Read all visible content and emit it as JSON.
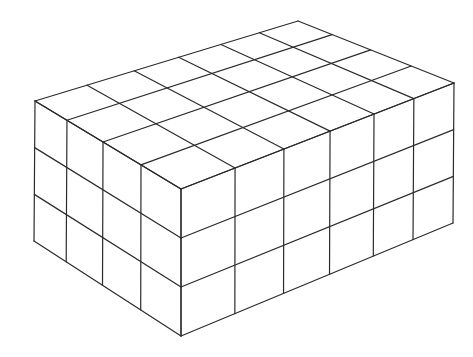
{
  "diagram": {
    "dimensions": {
      "depth_cubes": 4,
      "length_cubes": 6,
      "height_cubes": 3
    },
    "total_cubes": 72,
    "stroke_color": "#2b2b2b",
    "background_color": "#ffffff",
    "corners": {
      "A_left_top": [
        35,
        101
      ],
      "B_back_top": [
        298,
        21
      ],
      "C_right_top": [
        454,
        83
      ],
      "D_front_top": [
        181,
        189
      ],
      "E_left_bottom": [
        34,
        241
      ],
      "F_front_bottom": [
        181,
        336
      ],
      "G_right_bottom": [
        453,
        223
      ]
    },
    "left_face_divisions": [
      0.274,
      0.534,
      0.781
    ],
    "right_face_divisions": [
      0.198,
      0.377,
      0.546,
      0.707,
      0.853
    ],
    "height_divisions": [
      0.333,
      0.667
    ]
  }
}
